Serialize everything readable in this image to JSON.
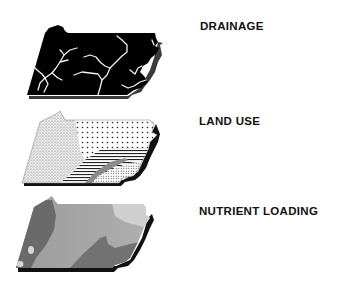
{
  "figure": {
    "panels": [
      {
        "id": "drainage",
        "label": "DRAINAGE",
        "fill": "#000000",
        "feature_color": "#f2f2f2",
        "shadow_color": "#3a3a3a"
      },
      {
        "id": "land_use",
        "label": "LAND USE",
        "fill_patterns": [
          "stippled",
          "dotted",
          "horizontal-lines",
          "fine-dots"
        ],
        "shadow_color": "#111111"
      },
      {
        "id": "nutrient_loading",
        "label": "NUTRIENT LOADING",
        "shades": [
          "#5e5e5e",
          "#8c8c8c",
          "#a8a8a8",
          "#c9c9c9"
        ],
        "shadow_color": "#111111"
      }
    ]
  }
}
